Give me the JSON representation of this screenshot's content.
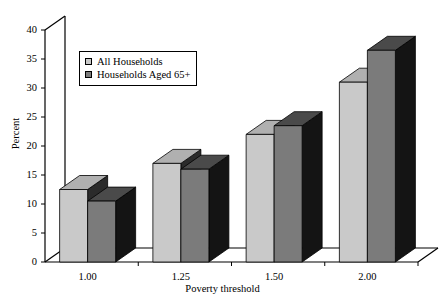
{
  "chart_data": {
    "type": "bar",
    "title": "",
    "subtitle": "",
    "xlabel": "Poverty threshold",
    "ylabel": "Percent",
    "categories": [
      "1.00",
      "1.25",
      "1.50",
      "2.00"
    ],
    "series": [
      {
        "name": "All Households",
        "values": [
          12.5,
          17,
          22,
          31
        ],
        "color": "#c9c9c9"
      },
      {
        "name": "Households Aged 65+",
        "values": [
          10.5,
          16,
          23.5,
          36.5
        ],
        "color": "#7b7b7b"
      }
    ],
    "ylim": [
      0,
      40
    ],
    "yticks": [
      "0",
      "5",
      "10",
      "15",
      "20",
      "25",
      "30",
      "35",
      "40"
    ],
    "ytick_values": [
      0,
      5,
      10,
      15,
      20,
      25,
      30,
      35,
      40
    ],
    "grid": false,
    "legend_position": "upper-left",
    "three_d": true,
    "annotations": []
  },
  "legend": {
    "entries": [
      {
        "label": "All Households"
      },
      {
        "label": "Households Aged 65+"
      }
    ]
  },
  "colors": {
    "series_light": "#c9c9c9",
    "series_light_top": "#b0b0b0",
    "series_light_side": "#2b2b2b",
    "series_dark": "#7b7b7b",
    "series_dark_top": "#4a4a4a",
    "series_dark_side": "#141414",
    "axis": "#000000",
    "background": "#ffffff"
  }
}
